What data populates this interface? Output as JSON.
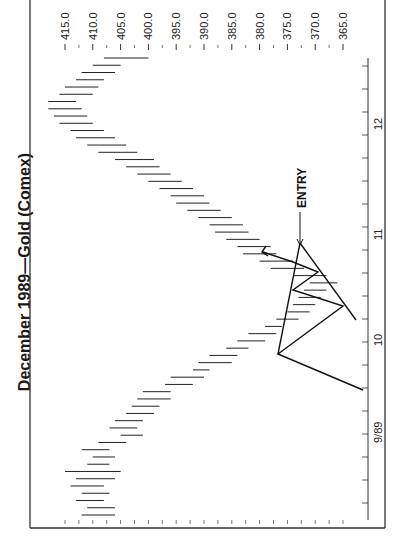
{
  "chart_data": {
    "type": "bar",
    "subtype": "ohlc-high-low-rotated",
    "orientation": "rotated-90-ccw",
    "title": "December 1989—Gold (Comex)",
    "xlabel": "",
    "ylabel": "",
    "price_axis": {
      "ticks": [
        "415.0",
        "410.0",
        "405.0",
        "400.0",
        "395.0",
        "390.0",
        "385.0",
        "380.0",
        "375.0",
        "370.0",
        "365.0"
      ],
      "range": [
        365.0,
        415.0
      ]
    },
    "date_axis": {
      "labels": [
        "9/89",
        "10",
        "11",
        "12"
      ],
      "minor_tick_spacing_px": 23
    },
    "annotations": [
      {
        "type": "text",
        "text": "ENTRY",
        "arrow_to": "breakout bar"
      },
      {
        "type": "pattern",
        "name": "symmetrical triangle / zigzag pattern with breakout arrow"
      }
    ],
    "series": [
      {
        "name": "High-Low range (approx, chronological)",
        "values": [
          [
            412,
            406
          ],
          [
            411,
            406
          ],
          [
            413,
            408
          ],
          [
            412,
            407
          ],
          [
            414,
            408
          ],
          [
            413,
            406
          ],
          [
            415,
            405
          ],
          [
            411,
            407
          ],
          [
            410,
            406
          ],
          [
            412,
            407
          ],
          [
            409,
            404
          ],
          [
            405,
            401
          ],
          [
            407,
            402
          ],
          [
            406,
            401
          ],
          [
            404,
            399
          ],
          [
            403,
            398
          ],
          [
            402,
            396
          ],
          [
            401,
            396
          ],
          [
            397,
            392
          ],
          [
            396,
            390
          ],
          [
            392,
            389
          ],
          [
            391,
            385
          ],
          [
            389,
            384
          ],
          [
            386,
            382
          ],
          [
            384,
            379
          ],
          [
            382,
            377
          ],
          [
            379,
            376
          ],
          [
            377,
            373
          ],
          [
            375,
            371
          ],
          [
            374,
            370
          ],
          [
            373,
            369
          ],
          [
            372,
            368
          ],
          [
            371,
            366
          ],
          [
            374,
            368
          ],
          [
            378,
            372
          ],
          [
            380,
            374
          ],
          [
            383,
            377
          ],
          [
            384,
            378
          ],
          [
            386,
            380
          ],
          [
            388,
            382
          ],
          [
            389,
            383
          ],
          [
            391,
            385
          ],
          [
            393,
            387
          ],
          [
            395,
            389
          ],
          [
            396,
            390
          ],
          [
            398,
            392
          ],
          [
            400,
            394
          ],
          [
            402,
            396
          ],
          [
            404,
            398
          ],
          [
            406,
            399
          ],
          [
            409,
            402
          ],
          [
            411,
            404
          ],
          [
            413,
            406
          ],
          [
            414,
            408
          ],
          [
            416,
            410
          ],
          [
            417,
            411
          ],
          [
            418,
            412
          ],
          [
            418,
            413
          ],
          [
            416,
            410
          ],
          [
            415,
            409
          ],
          [
            413,
            408
          ],
          [
            412,
            406
          ],
          [
            410,
            405
          ],
          [
            408,
            400
          ]
        ]
      }
    ],
    "grid": false,
    "legend": null
  },
  "labels": {
    "title": "December 1989—Gold (Comex)",
    "entry": "ENTRY",
    "price_ticks": [
      "415.0",
      "410.0",
      "405.0",
      "400.0",
      "395.0",
      "390.0",
      "385.0",
      "380.0",
      "375.0",
      "370.0",
      "365.0"
    ],
    "date_ticks": [
      "9/89",
      "10",
      "11",
      "12"
    ]
  }
}
